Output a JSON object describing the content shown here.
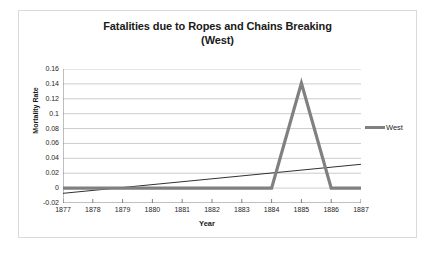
{
  "chart_data": {
    "type": "line",
    "title": "Fatalities due to Ropes and Chains Breaking (West)",
    "title_line1": "Fatalities due to Ropes and Chains Breaking",
    "title_line2": "(West)",
    "xlabel": "Year",
    "ylabel": "Mortality Rate",
    "categories": [
      "1877",
      "1878",
      "1879",
      "1880",
      "1881",
      "1882",
      "1883",
      "1884",
      "1885",
      "1886",
      "1887"
    ],
    "ylim": [
      -0.02,
      0.16
    ],
    "ytick_labels": [
      "0.16",
      "0.14",
      "0.12",
      "0.1",
      "0.08",
      "0.06",
      "0.04",
      "0.02",
      "0",
      "-0.02"
    ],
    "ytick_values": [
      0.16,
      0.14,
      0.12,
      0.1,
      0.08,
      0.06,
      0.04,
      0.02,
      0,
      -0.02
    ],
    "grid": "horizontal",
    "legend_position": "right",
    "series": [
      {
        "name": "West",
        "color": "#808080",
        "width": 3.2,
        "values": [
          0,
          0,
          0,
          0,
          0,
          0,
          0,
          0,
          0.141,
          0,
          0
        ]
      }
    ],
    "trendline": {
      "name": "Linear trend",
      "color": "#1a1a1a",
      "width": 0.9,
      "start_value": -0.007,
      "end_value": 0.032
    }
  },
  "legend": {
    "entries": [
      {
        "label": "West",
        "color": "#808080"
      }
    ]
  },
  "colors": {
    "series": "#808080",
    "trendline": "#1a1a1a",
    "gridline": "#bfbfbf",
    "axis": "#808080",
    "border": "#d9d9d9",
    "text": "#262626"
  }
}
